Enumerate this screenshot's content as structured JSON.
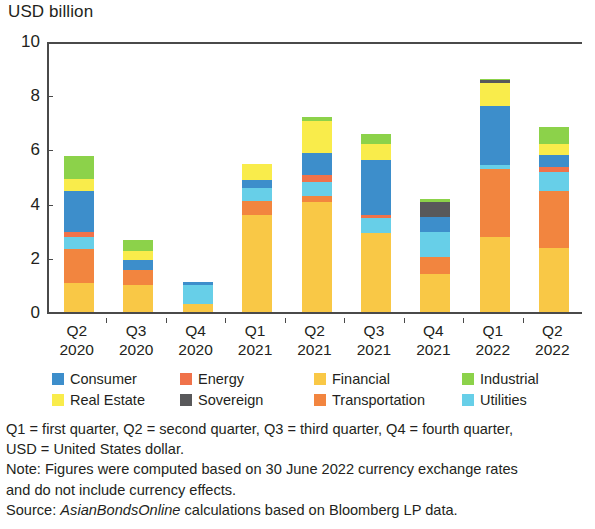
{
  "axis_title": "USD billion",
  "legend": [
    {
      "label": "Consumer",
      "color": "#3d8ecb",
      "icon": "legend-swatch-icon"
    },
    {
      "label": "Energy",
      "color": "#f0724a",
      "icon": "legend-swatch-icon"
    },
    {
      "label": "Financial",
      "color": "#f9c846",
      "icon": "legend-swatch-icon"
    },
    {
      "label": "Industrial",
      "color": "#8cd24a",
      "icon": "legend-swatch-icon"
    },
    {
      "label": "Real Estate",
      "color": "#f9ec4b",
      "icon": "legend-swatch-icon"
    },
    {
      "label": "Sovereign",
      "color": "#58585a",
      "icon": "legend-swatch-icon"
    },
    {
      "label": "Transportation",
      "color": "#f2853f",
      "icon": "legend-swatch-icon"
    },
    {
      "label": "Utilities",
      "color": "#67cfe8",
      "icon": "legend-swatch-icon"
    }
  ],
  "footnotes": {
    "line1": "Q1 = first quarter, Q2 = second quarter, Q3 = third quarter, Q4 = fourth quarter,",
    "line2": "USD = United States dollar.",
    "line3": "Note: Figures were computed based on 30 June 2022 currency exchange rates",
    "line4": "and do not include currency effects.",
    "source_prefix": "Source: ",
    "source_italic": "AsianBondsOnline",
    "source_suffix": " calculations based on Bloomberg LP data."
  },
  "chart_data": {
    "type": "bar",
    "stacked": true,
    "title": "",
    "xlabel": "",
    "ylabel": "USD billion",
    "ylim": [
      0,
      10
    ],
    "yticks": [
      0,
      2,
      4,
      6,
      8,
      10
    ],
    "grid": false,
    "legend_position": "below-plot",
    "categories": [
      "Q2 2020",
      "Q3 2020",
      "Q4 2020",
      "Q1 2021",
      "Q2 2021",
      "Q3 2021",
      "Q4 2021",
      "Q1 2022",
      "Q2 2022"
    ],
    "category_labels": [
      {
        "quarter": "Q2",
        "year": "2020"
      },
      {
        "quarter": "Q3",
        "year": "2020"
      },
      {
        "quarter": "Q4",
        "year": "2020"
      },
      {
        "quarter": "Q1",
        "year": "2021"
      },
      {
        "quarter": "Q2",
        "year": "2021"
      },
      {
        "quarter": "Q3",
        "year": "2021"
      },
      {
        "quarter": "Q4",
        "year": "2021"
      },
      {
        "quarter": "Q1",
        "year": "2022"
      },
      {
        "quarter": "Q2",
        "year": "2022"
      }
    ],
    "series": [
      {
        "name": "Financial",
        "color": "#f9c846",
        "values": [
          1.1,
          1.05,
          0.35,
          3.6,
          4.1,
          2.95,
          1.45,
          2.8,
          2.4
        ]
      },
      {
        "name": "Transportation",
        "color": "#f2853f",
        "values": [
          1.25,
          0.55,
          0.0,
          0.55,
          0.2,
          0.0,
          0.6,
          2.5,
          2.1
        ]
      },
      {
        "name": "Utilities",
        "color": "#67cfe8",
        "values": [
          0.45,
          0.0,
          0.7,
          0.45,
          0.55,
          0.55,
          0.95,
          0.15,
          0.7
        ]
      },
      {
        "name": "Energy",
        "color": "#f0724a",
        "values": [
          0.2,
          0.0,
          0.0,
          0.0,
          0.25,
          0.1,
          0.0,
          0.0,
          0.2
        ]
      },
      {
        "name": "Consumer",
        "color": "#3d8ecb",
        "values": [
          1.5,
          0.35,
          0.1,
          0.3,
          0.8,
          2.05,
          0.55,
          2.2,
          0.45
        ]
      },
      {
        "name": "Real Estate",
        "color": "#f9ec4b",
        "values": [
          0.45,
          0.35,
          0.0,
          0.6,
          1.2,
          0.6,
          0.0,
          0.85,
          0.4
        ]
      },
      {
        "name": "Sovereign",
        "color": "#58585a",
        "values": [
          0.0,
          0.0,
          0.0,
          0.0,
          0.0,
          0.0,
          0.55,
          0.1,
          0.0
        ]
      },
      {
        "name": "Industrial",
        "color": "#8cd24a",
        "values": [
          0.85,
          0.4,
          0.0,
          0.0,
          0.15,
          0.35,
          0.1,
          0.05,
          0.6
        ]
      }
    ],
    "totals": [
      5.8,
      2.7,
      1.15,
      5.5,
      7.25,
      6.6,
      4.2,
      8.65,
      6.85
    ]
  }
}
